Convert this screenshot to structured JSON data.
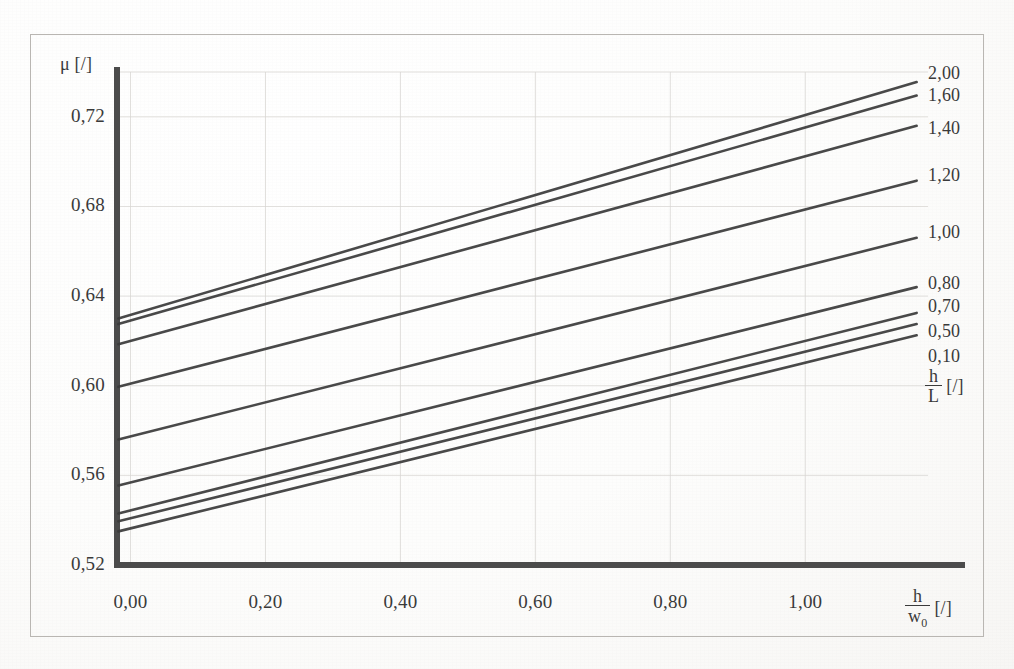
{
  "figure": {
    "background_color": "#fdfdfc",
    "frame_color": "#b9b6b2",
    "ink_color": "#3a3a3a",
    "grid_color": "#d8d6d2"
  },
  "axes": {
    "y_symbol": "μ",
    "y_unit": "[/]",
    "x_num": "h",
    "x_den": "w",
    "x_den_sub": "0",
    "x_unit": "[/]"
  },
  "legend": {
    "title_num": "h",
    "title_den": "L",
    "title_unit": "[/]"
  },
  "chart_data": {
    "type": "line",
    "title": "",
    "xlabel": "h/w0 [/]",
    "ylabel": "μ [/]",
    "xlim": [
      -0.02,
      1.17
    ],
    "ylim": [
      0.52,
      0.74
    ],
    "xticks": [
      0.0,
      0.2,
      0.4,
      0.6,
      0.8,
      1.0
    ],
    "xtick_labels": [
      "0,00",
      "0,20",
      "0,40",
      "0,60",
      "0,80",
      "1,00"
    ],
    "yticks": [
      0.52,
      0.56,
      0.6,
      0.64,
      0.68,
      0.72
    ],
    "ytick_labels": [
      "0,52",
      "0,56",
      "0,60",
      "0,64",
      "0,68",
      "0,72"
    ],
    "grid": true,
    "grid_style": "faint solid",
    "legend_position": "right-outside",
    "series_label_key": "h/L",
    "series": [
      {
        "name": "2,00",
        "label": "2,00",
        "x": [
          -0.018,
          1.165
        ],
        "values": [
          0.63,
          0.7355
        ]
      },
      {
        "name": "1,60",
        "label": "1,60",
        "x": [
          -0.018,
          1.165
        ],
        "values": [
          0.6275,
          0.7295
        ]
      },
      {
        "name": "1,40",
        "label": "1,40",
        "x": [
          -0.018,
          1.165
        ],
        "values": [
          0.6185,
          0.716
        ]
      },
      {
        "name": "1,20",
        "label": "1,20",
        "x": [
          -0.018,
          1.165
        ],
        "values": [
          0.5995,
          0.6915
        ]
      },
      {
        "name": "1,00",
        "label": "1,00",
        "x": [
          -0.018,
          1.165
        ],
        "values": [
          0.576,
          0.666
        ]
      },
      {
        "name": "0,80",
        "label": "0,80",
        "x": [
          -0.018,
          1.165
        ],
        "values": [
          0.5555,
          0.644
        ]
      },
      {
        "name": "0,70",
        "label": "0,70",
        "x": [
          -0.018,
          1.165
        ],
        "values": [
          0.543,
          0.6325
        ]
      },
      {
        "name": "0,50",
        "label": "0,50",
        "x": [
          -0.018,
          1.165
        ],
        "values": [
          0.5395,
          0.6275
        ]
      },
      {
        "name": "0,10",
        "label": "0,10",
        "x": [
          -0.018,
          1.165
        ],
        "values": [
          0.535,
          0.6225
        ]
      }
    ],
    "legend_entries": [
      "2,00",
      "1,60",
      "1,40",
      "1,20",
      "1,00",
      "0,80",
      "0,70",
      "0,50",
      "0,10"
    ]
  }
}
